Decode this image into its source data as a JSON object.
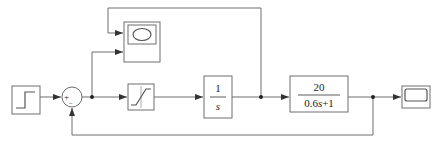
{
  "diagram": {
    "type": "simulink-block-diagram",
    "blocks": {
      "step": {
        "name": "Step",
        "icon": "step-icon"
      },
      "sum": {
        "name": "Sum",
        "signs": {
          "plus": "+",
          "minus": "−"
        }
      },
      "saturation": {
        "name": "Saturation",
        "icon": "saturation-icon"
      },
      "integrator": {
        "name": "Integrator",
        "numerator": "1",
        "denominator": "s"
      },
      "transfer_fcn": {
        "name": "Transfer Fcn",
        "numerator": "20",
        "denominator_prefix": "0.6",
        "denominator_var": "s",
        "denominator_suffix": "+1"
      },
      "xy_scope": {
        "name": "XY Graph",
        "icon": "xy-graph-icon"
      },
      "scope": {
        "name": "Scope",
        "icon": "scope-icon"
      }
    },
    "colors": {
      "line": "#6e6e6e",
      "arrow": "#333333",
      "background": "#ffffff"
    }
  }
}
